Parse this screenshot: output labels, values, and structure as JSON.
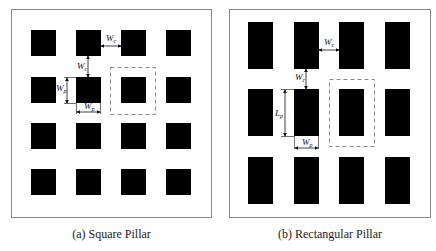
{
  "panels": [
    {
      "id": "a",
      "caption": "(a) Square Pillar",
      "pillar_shape": "square",
      "grid": {
        "rows": 4,
        "cols": 4
      },
      "labels": {
        "spacing_horizontal": "W",
        "spacing_horizontal_sub": "c",
        "spacing_vertical": "W",
        "spacing_vertical_sub": "c",
        "pillar_height": "W",
        "pillar_height_sub": "p",
        "pillar_width": "W",
        "pillar_width_sub": "p"
      }
    },
    {
      "id": "b",
      "caption": "(b) Rectangular Pillar",
      "pillar_shape": "rectangle",
      "grid": {
        "rows": 3,
        "cols": 4
      },
      "labels": {
        "spacing_horizontal": "W",
        "spacing_horizontal_sub": "c",
        "spacing_vertical": "W",
        "spacing_vertical_sub": "c",
        "pillar_length": "L",
        "pillar_length_sub": "p",
        "pillar_width": "W",
        "pillar_width_sub": "p"
      }
    }
  ],
  "colors": {
    "pillar": "#000000",
    "frame": "#8a8a8a",
    "dashed_cell": "#888888",
    "background": "#ffffff"
  }
}
